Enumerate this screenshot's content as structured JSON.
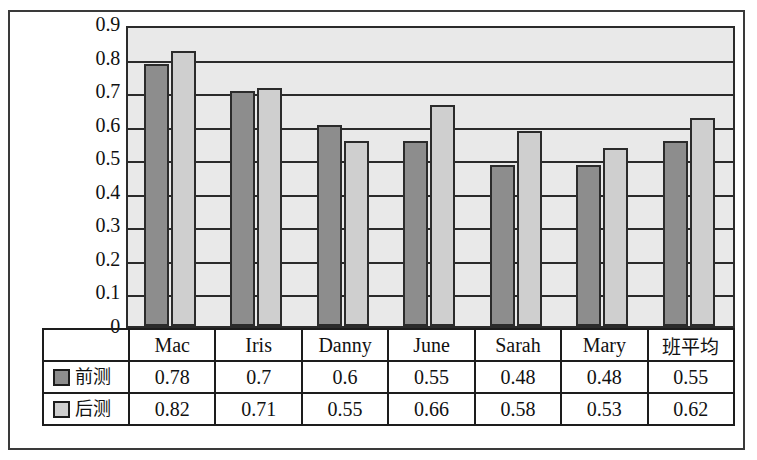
{
  "chart_data": {
    "type": "bar",
    "title": "",
    "xlabel": "",
    "ylabel": "",
    "ylim": [
      0,
      0.9
    ],
    "grid": true,
    "legend_position": "table-left",
    "categories": [
      "Mac",
      "Iris",
      "Danny",
      "June",
      "Sarah",
      "Mary",
      "班平均"
    ],
    "ytick_labels": [
      "0.9",
      "0.8",
      "0.7",
      "0.6",
      "0.5",
      "0.4",
      "0.3",
      "0.2",
      "0.1",
      "0"
    ],
    "ytick_values": [
      0.9,
      0.8,
      0.7,
      0.6,
      0.5,
      0.4,
      0.3,
      0.2,
      0.1,
      0
    ],
    "series": [
      {
        "name": "前测",
        "color": "#8d8d8d",
        "values": [
          0.78,
          0.7,
          0.6,
          0.55,
          0.48,
          0.48,
          0.55
        ],
        "labels": [
          "0.78",
          "0.7",
          "0.6",
          "0.55",
          "0.48",
          "0.48",
          "0.55"
        ]
      },
      {
        "name": "后测",
        "color": "#cfcfcf",
        "values": [
          0.82,
          0.71,
          0.55,
          0.66,
          0.58,
          0.53,
          0.62
        ],
        "labels": [
          "0.82",
          "0.71",
          "0.55",
          "0.66",
          "0.58",
          "0.53",
          "0.62"
        ]
      }
    ]
  },
  "colors": {
    "plot_background": "#e9e9e9",
    "axis_line": "#2b2b2b",
    "frame": "#3a3a3a",
    "series_pre": "#8d8d8d",
    "series_post": "#cfcfcf"
  }
}
